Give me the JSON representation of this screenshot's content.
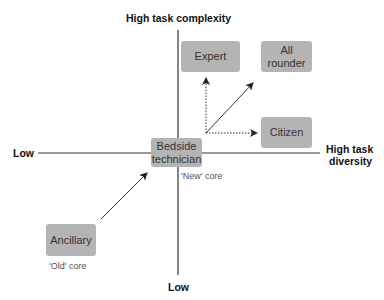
{
  "axes": {
    "top": "High task complexity",
    "bottom": "Low",
    "left": "Low",
    "right_line1": "High task",
    "right_line2": "diversity"
  },
  "boxes": {
    "expert": "Expert",
    "all_rounder_line1": "All",
    "all_rounder_line2": "rounder",
    "citizen": "Citizen",
    "bedside_line1": "Bedside",
    "bedside_line2": "technician",
    "ancillary": "Ancillary"
  },
  "notes": {
    "new_core": "'New' core",
    "old_core": "'Old' core"
  },
  "colors": {
    "box": "#b4b4b4",
    "line": "#222222"
  }
}
